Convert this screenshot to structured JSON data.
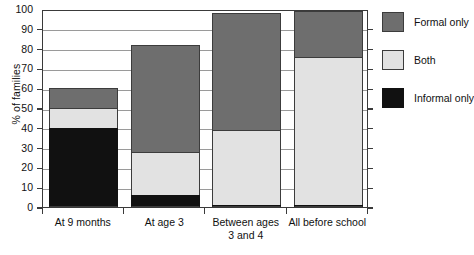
{
  "chart_data": {
    "type": "bar",
    "subtype": "stacked-bar",
    "title": "",
    "xlabel": "",
    "ylabel": "% of families",
    "ylim": [
      0,
      100
    ],
    "ytick_step": 10,
    "yticks": [
      0,
      10,
      20,
      30,
      40,
      50,
      60,
      70,
      80,
      90,
      100
    ],
    "grid": true,
    "grid_axis": "y",
    "legend_position": "right",
    "categories": [
      "At 9 months",
      "At age 3",
      "Between ages 3 and 4",
      "All before school"
    ],
    "category_lines": [
      [
        "At 9 months"
      ],
      [
        "At age 3"
      ],
      [
        "Between ages",
        "3 and 4"
      ],
      [
        "All before school"
      ]
    ],
    "series": [
      {
        "name": "Informal only",
        "color": "#111111",
        "values": [
          40,
          6,
          1,
          1
        ]
      },
      {
        "name": "Both",
        "color": "#e2e2e2",
        "values": [
          10,
          22,
          38,
          75
        ]
      },
      {
        "name": "Formal only",
        "color": "#6e6e6e",
        "values": [
          10,
          54,
          59,
          23
        ]
      }
    ],
    "stack_totals": [
      60,
      82,
      98,
      99
    ],
    "stack_order_bottom_to_top": [
      "Informal only",
      "Both",
      "Formal only"
    ]
  },
  "legend": {
    "items": [
      {
        "label": "Formal only",
        "key": "formal"
      },
      {
        "label": "Both",
        "key": "both"
      },
      {
        "label": "Informal only",
        "key": "informal"
      }
    ]
  },
  "colors": {
    "formal_only": "#6e6e6e",
    "both": "#e2e2e2",
    "informal_only": "#111111",
    "axis": "#3a3a3a",
    "grid": "#9a9a9a",
    "background": "#ffffff"
  }
}
